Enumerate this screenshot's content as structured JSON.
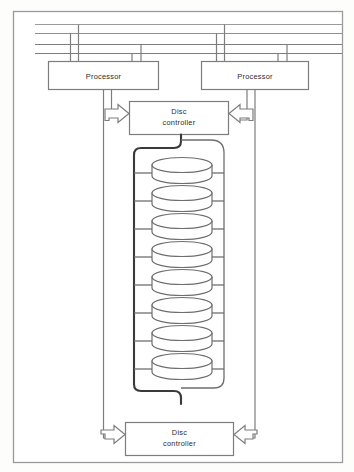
{
  "figure": {
    "frame": {
      "stroke": "#9a9a9a",
      "fill": "#ffffff"
    },
    "colors": {
      "bus_line": "#8f8f8f",
      "box_stroke": "#7d7d7d",
      "thick_bus": "#3a3a3a",
      "disc_stroke": "#6e6e6e",
      "arrow_stroke": "#7d7d7d",
      "text": "#2b2b2b"
    }
  },
  "buses": {
    "count": 4,
    "labels": [
      "bus-line-1",
      "bus-line-2",
      "bus-line-3",
      "bus-line-4"
    ]
  },
  "processors": [
    {
      "id": "processor-left",
      "label": "Processor"
    },
    {
      "id": "processor-right",
      "label": "Processor"
    }
  ],
  "controllers": [
    {
      "id": "disc-controller-top",
      "line1": "Disc",
      "line2": "controller"
    },
    {
      "id": "disc-controller-bottom",
      "line1": "Disc",
      "line2": "controller"
    }
  ],
  "discs": {
    "count": 8,
    "labels": [
      "disc-1",
      "disc-2",
      "disc-3",
      "disc-4",
      "disc-5",
      "disc-6",
      "disc-7",
      "disc-8"
    ]
  },
  "arrows": [
    {
      "id": "arrow-to-top-controller-left",
      "direction": "right"
    },
    {
      "id": "arrow-to-top-controller-right",
      "direction": "left"
    },
    {
      "id": "arrow-to-bottom-controller-left",
      "direction": "right"
    },
    {
      "id": "arrow-to-bottom-controller-right",
      "direction": "left"
    }
  ]
}
